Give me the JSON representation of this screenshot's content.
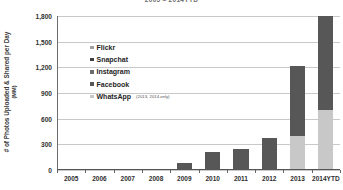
{
  "chart_data": {
    "type": "bar",
    "title": "2005 – 2014YTD",
    "xlabel": "",
    "ylabel": "# of Photos Uploaded & Shared per Day",
    "yunit": "(MM)",
    "ylim": [
      0,
      1800
    ],
    "yticks": [
      0,
      300,
      600,
      900,
      1200,
      1500,
      1800
    ],
    "ytick_labels": [
      "0",
      "300",
      "600",
      "900",
      "1,200",
      "1,500",
      "1,800"
    ],
    "grid": true,
    "stacked": true,
    "legend_position": "inside-upper-left",
    "categories": [
      "2005",
      "2006",
      "2007",
      "2008",
      "2009",
      "2010",
      "2011",
      "2012",
      "2013",
      "2014YTD"
    ],
    "series": [
      {
        "name": "WhatsApp",
        "note": "(2013, 2014 only)",
        "color": "#c8c8c8",
        "values": [
          0,
          0,
          0,
          0,
          0,
          0,
          0,
          0,
          400,
          700
        ]
      },
      {
        "name": "Flickr + Snapchat + Instagram + Facebook",
        "color": "#575757",
        "values": [
          1,
          2,
          3,
          5,
          80,
          205,
          245,
          375,
          810,
          1100
        ]
      }
    ],
    "totals": [
      1,
      2,
      3,
      5,
      80,
      205,
      245,
      375,
      1210,
      1800
    ],
    "legend_entries": [
      {
        "label": "Flickr",
        "color": "#9e9e9e",
        "note": ""
      },
      {
        "label": "Snapchat",
        "color": "#3f3f3f",
        "note": ""
      },
      {
        "label": "Instagram",
        "color": "#6b6b6b",
        "note": ""
      },
      {
        "label": "Facebook",
        "color": "#575757",
        "note": ""
      },
      {
        "label": "WhatsApp",
        "color": "#c8c8c8",
        "note": "(2013, 2014 only)"
      }
    ]
  }
}
